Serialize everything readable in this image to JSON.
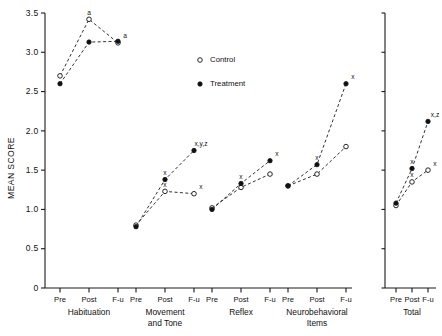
{
  "chart_data": {
    "type": "line",
    "title": "",
    "xlabel": "",
    "ylabel": "MEAN SCORE",
    "ylim": [
      0,
      3.5
    ],
    "ytick_labels": [
      "0",
      "0.5",
      "1.0",
      "1.5",
      "2.0",
      "2.5",
      "3.0",
      "3.5"
    ],
    "ytick_values": [
      0,
      0.5,
      1.0,
      1.5,
      2.0,
      2.5,
      3.0,
      3.5
    ],
    "grid": false,
    "legend_position": "upper-right-inside",
    "timepoints": [
      "Pre",
      "Post",
      "F-u"
    ],
    "legend": [
      {
        "name": "Control",
        "marker": "open-circle"
      },
      {
        "name": "Treatment",
        "marker": "filled-circle"
      }
    ],
    "panels": [
      {
        "group": "Habituation",
        "group_label_lines": [
          "Habituation"
        ],
        "series": [
          {
            "name": "Control",
            "values": [
              2.7,
              3.42,
              3.12
            ],
            "annotations": [
              "",
              "a",
              "a"
            ]
          },
          {
            "name": "Treatment",
            "values": [
              2.6,
              3.13,
              3.14
            ],
            "annotations": [
              "",
              "",
              ""
            ]
          }
        ]
      },
      {
        "group": "Movement and Tone",
        "group_label_lines": [
          "Movement",
          "and Tone"
        ],
        "series": [
          {
            "name": "Control",
            "values": [
              0.8,
              1.23,
              1.2
            ],
            "annotations": [
              "",
              "x",
              "x"
            ]
          },
          {
            "name": "Treatment",
            "values": [
              0.78,
              1.38,
              1.75
            ],
            "annotations": [
              "",
              "x",
              "x,y,z"
            ]
          }
        ]
      },
      {
        "group": "Reflex",
        "group_label_lines": [
          "Reflex"
        ],
        "series": [
          {
            "name": "Control",
            "values": [
              1.02,
              1.28,
              1.45
            ],
            "annotations": [
              "",
              "",
              ""
            ]
          },
          {
            "name": "Treatment",
            "values": [
              1.0,
              1.33,
              1.62
            ],
            "annotations": [
              "",
              "x",
              "x"
            ]
          }
        ]
      },
      {
        "group": "Neurobehavioral Items",
        "group_label_lines": [
          "Neurobehavioral",
          "Items"
        ],
        "series": [
          {
            "name": "Control",
            "values": [
              1.3,
              1.45,
              1.8
            ],
            "annotations": [
              "",
              "",
              ""
            ]
          },
          {
            "name": "Treatment",
            "values": [
              1.3,
              1.57,
              2.6
            ],
            "annotations": [
              "",
              "x",
              "x"
            ]
          }
        ]
      },
      {
        "group": "Total",
        "group_label_lines": [
          "Total"
        ],
        "separate_panel": true,
        "series": [
          {
            "name": "Control",
            "values": [
              1.05,
              1.35,
              1.5
            ],
            "annotations": [
              "",
              "x",
              "x"
            ]
          },
          {
            "name": "Treatment",
            "values": [
              1.08,
              1.52,
              2.12
            ],
            "annotations": [
              "",
              "x",
              "x,z"
            ]
          }
        ]
      }
    ]
  }
}
